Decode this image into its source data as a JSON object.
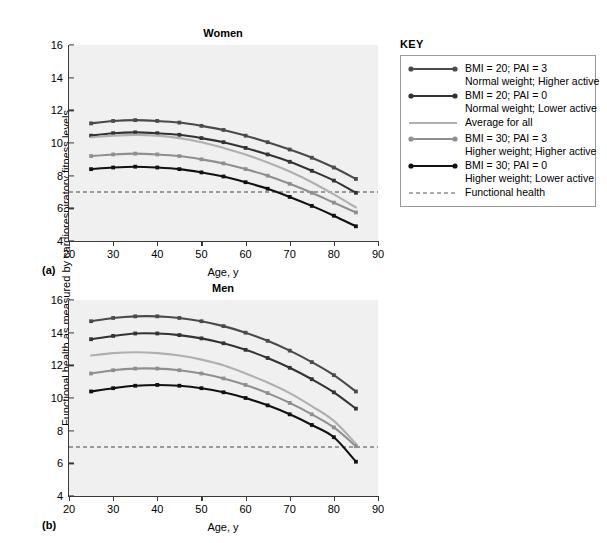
{
  "ylabel": "Functional health as measured by cardiorespiratory fitness levels",
  "xlabel": "Age, y",
  "key": {
    "title": "KEY",
    "entries": [
      {
        "line1": "BMI = 20; PAI = 3",
        "line2": "Normal weight; Higher active",
        "color": "#4a4a4a",
        "markers": true,
        "dashed": false
      },
      {
        "line1": "BMI = 20; PAI = 0",
        "line2": "Normal weight; Lower active",
        "color": "#333333",
        "markers": true,
        "dashed": false
      },
      {
        "line1": "Average for all",
        "line2": "",
        "color": "#b0b0b0",
        "markers": false,
        "dashed": false
      },
      {
        "line1": "BMI = 30; PAI = 3",
        "line2": "Higher weight; Higher active",
        "color": "#8f8f8f",
        "markers": true,
        "dashed": false
      },
      {
        "line1": "BMI = 30; PAI = 0",
        "line2": "Higher weight; Lower active",
        "color": "#111111",
        "markers": true,
        "dashed": false
      },
      {
        "line1": "Functional health",
        "line2": "",
        "color": "#555555",
        "markers": false,
        "dashed": true
      }
    ]
  },
  "chart_data": [
    {
      "type": "line",
      "title": "Women",
      "panel_letter": "(a)",
      "xlabel": "Age, y",
      "ylabel": "Functional health as measured by cardiorespiratory fitness levels",
      "xlim": [
        20,
        90
      ],
      "ylim": [
        4,
        16
      ],
      "xticks": [
        20,
        30,
        40,
        50,
        60,
        70,
        80,
        90
      ],
      "yticks": [
        4,
        6,
        8,
        10,
        12,
        14,
        16
      ],
      "grid": false,
      "legend_position": "right-outside",
      "threshold_line": {
        "label": "Functional health",
        "value": 7,
        "style": "dashed"
      },
      "x": [
        25,
        30,
        35,
        40,
        45,
        50,
        55,
        60,
        65,
        70,
        75,
        80,
        85
      ],
      "series": [
        {
          "name": "BMI = 20; PAI = 3",
          "color": "#4a4a4a",
          "values": [
            11.2,
            11.35,
            11.4,
            11.35,
            11.25,
            11.05,
            10.8,
            10.45,
            10.05,
            9.6,
            9.1,
            8.5,
            7.8
          ]
        },
        {
          "name": "BMI = 20; PAI = 0",
          "color": "#333333",
          "values": [
            10.45,
            10.6,
            10.65,
            10.6,
            10.5,
            10.3,
            10.05,
            9.7,
            9.3,
            8.85,
            8.3,
            7.7,
            6.95
          ]
        },
        {
          "name": "Average for all",
          "color": "#b0b0b0",
          "values": [
            10.35,
            10.45,
            10.5,
            10.45,
            10.3,
            10.05,
            9.7,
            9.3,
            8.8,
            8.25,
            7.6,
            6.85,
            6.05
          ]
        },
        {
          "name": "BMI = 30; PAI = 3",
          "color": "#8f8f8f",
          "values": [
            9.2,
            9.3,
            9.35,
            9.3,
            9.2,
            9.0,
            8.75,
            8.4,
            8.0,
            7.5,
            6.95,
            6.35,
            5.75
          ]
        },
        {
          "name": "BMI = 30; PAI = 0",
          "color": "#111111",
          "values": [
            8.4,
            8.5,
            8.55,
            8.5,
            8.4,
            8.2,
            7.95,
            7.6,
            7.2,
            6.7,
            6.15,
            5.55,
            4.9
          ]
        }
      ]
    },
    {
      "type": "line",
      "title": "Men",
      "panel_letter": "(b)",
      "xlabel": "Age, y",
      "ylabel": "Functional health as measured by cardiorespiratory fitness levels",
      "xlim": [
        20,
        90
      ],
      "ylim": [
        4,
        16
      ],
      "xticks": [
        20,
        30,
        40,
        50,
        60,
        70,
        80,
        90
      ],
      "yticks": [
        4,
        6,
        8,
        10,
        12,
        14,
        16
      ],
      "grid": false,
      "legend_position": "right-outside",
      "threshold_line": {
        "label": "Functional health",
        "value": 7,
        "style": "dashed"
      },
      "x": [
        25,
        30,
        35,
        40,
        45,
        50,
        55,
        60,
        65,
        70,
        75,
        80,
        85
      ],
      "series": [
        {
          "name": "BMI = 20; PAI = 3",
          "color": "#4a4a4a",
          "values": [
            14.7,
            14.9,
            15.0,
            15.0,
            14.9,
            14.7,
            14.4,
            14.0,
            13.5,
            12.9,
            12.2,
            11.4,
            10.4
          ]
        },
        {
          "name": "BMI = 20; PAI = 0",
          "color": "#333333",
          "values": [
            13.6,
            13.8,
            13.95,
            13.95,
            13.85,
            13.65,
            13.35,
            12.95,
            12.45,
            11.85,
            11.15,
            10.35,
            9.35
          ]
        },
        {
          "name": "Average for all",
          "color": "#b0b0b0",
          "values": [
            12.6,
            12.75,
            12.8,
            12.75,
            12.6,
            12.35,
            12.0,
            11.5,
            10.95,
            10.3,
            9.5,
            8.6,
            7.2
          ]
        },
        {
          "name": "BMI = 30; PAI = 3",
          "color": "#8f8f8f",
          "values": [
            11.5,
            11.7,
            11.8,
            11.8,
            11.7,
            11.5,
            11.2,
            10.8,
            10.3,
            9.7,
            9.0,
            8.2,
            7.05
          ]
        },
        {
          "name": "BMI = 30; PAI = 0",
          "color": "#111111",
          "values": [
            10.4,
            10.6,
            10.75,
            10.8,
            10.75,
            10.6,
            10.35,
            10.0,
            9.55,
            9.0,
            8.35,
            7.6,
            6.1
          ]
        }
      ]
    }
  ]
}
